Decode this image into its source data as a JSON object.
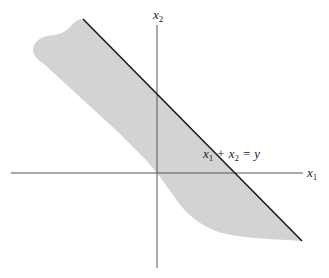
{
  "diagram": {
    "type": "halfplane-region",
    "axes": {
      "x_label": {
        "var": "x",
        "sub": "1"
      },
      "y_label": {
        "var": "x",
        "sub": "2"
      },
      "color": "#555555"
    },
    "boundary_line": {
      "equation_parts": {
        "a_var": "x",
        "a_sub": "1",
        "plus": "+",
        "b_var": "x",
        "b_sub": "2",
        "eq": "=",
        "rhs": "y"
      },
      "color": "#1a1a1a"
    },
    "region": {
      "description": "shaded region below/left of the line x1 + x2 = y",
      "fill_color": "#d3d3d3"
    }
  }
}
